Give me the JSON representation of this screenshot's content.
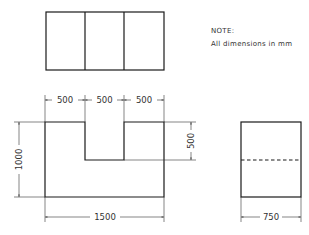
{
  "note": {
    "title": "NOTE:",
    "text": "All dimensions in mm"
  },
  "views": {
    "top_view": {
      "name": "Top view",
      "divisions": 3
    },
    "front_view": {
      "name": "Front view",
      "shape": "U-shaped block with central notch"
    },
    "side_view": {
      "name": "Side view",
      "hidden_line": "dashed line at notch depth"
    }
  },
  "dimensions": {
    "top_segment_1": "500",
    "top_segment_2": "500",
    "top_segment_3": "500",
    "height_total": "1000",
    "notch_depth": "500",
    "width_total": "1500",
    "side_width": "750"
  },
  "colors": {
    "line": "#1a1a1a",
    "dimension": "#333333",
    "background": "#ffffff"
  }
}
